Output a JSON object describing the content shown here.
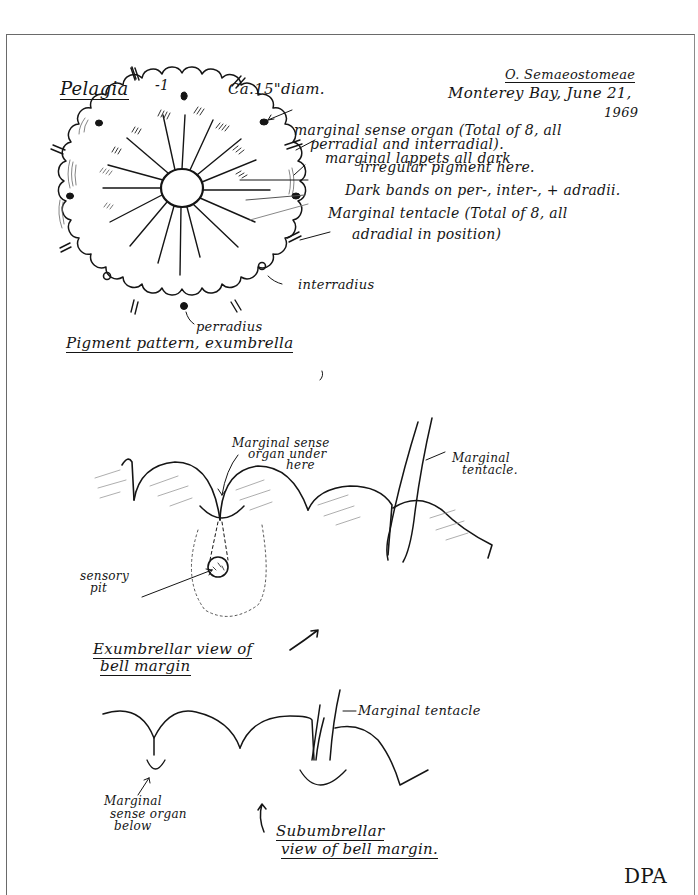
{
  "page": {
    "genus_title": "Pelagia",
    "plate_number": "-1",
    "diameter": "Ca.15\"diam.",
    "order": "O. Semaeostomeae",
    "locality_date_line1": "Monterey Bay, June 21,",
    "locality_date_line2": "1969",
    "initials": "DPA"
  },
  "figure_1": {
    "caption": "Pigment pattern, exumbrella",
    "labels": {
      "sense_organ_line1": "marginal sense organ (Total of 8, all",
      "sense_organ_line2": "perradial and interradial).",
      "lappets": "marginal lappets all dark",
      "irregular_pigment": "irregular pigment here.",
      "dark_bands": "Dark bands on per-, inter-, + adradii.",
      "tentacle_line1": "Marginal tentacle (Total of 8, all",
      "tentacle_line2": "adradial in position)",
      "interradius": "interradius",
      "perradius": "perradius"
    }
  },
  "figure_2": {
    "caption_line1": "Exumbrellar view of",
    "caption_line2": "bell margin",
    "labels": {
      "sense_organ_line1": "Marginal sense",
      "sense_organ_line2": "organ under",
      "sense_organ_line3": "here",
      "tentacle_line1": "Marginal",
      "tentacle_line2": "tentacle.",
      "sensory_pit_line1": "sensory",
      "sensory_pit_line2": "pit"
    }
  },
  "figure_3": {
    "caption_line1": "Subumbrellar",
    "caption_line2": "view of bell margin.",
    "labels": {
      "tentacle": "Marginal tentacle",
      "sense_organ_line1": "Marginal",
      "sense_organ_line2": "sense organ",
      "sense_organ_line3": "below"
    }
  },
  "colors": {
    "ink": "#151515",
    "paper": "#ffffff",
    "border": "#6a6a6a"
  }
}
